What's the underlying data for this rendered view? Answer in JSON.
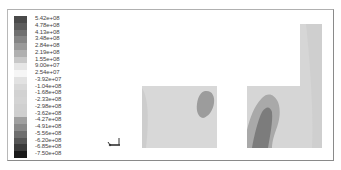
{
  "chart_data": {
    "type": "heatmap",
    "title": "",
    "xlabel": "",
    "ylabel": "",
    "legend": {
      "position": "left",
      "levels": [
        {
          "label": "5.42e+08",
          "value": 542000000,
          "color": "#4a4a4a"
        },
        {
          "label": "4.78e+08",
          "value": 478000000,
          "color": "#5c5c5c"
        },
        {
          "label": "4.13e+08",
          "value": 413000000,
          "color": "#707070"
        },
        {
          "label": "3.48e+08",
          "value": 348000000,
          "color": "#858585"
        },
        {
          "label": "2.84e+08",
          "value": 284000000,
          "color": "#9a9a9a"
        },
        {
          "label": "2.19e+08",
          "value": 219000000,
          "color": "#b0b0b0"
        },
        {
          "label": "1.55e+08",
          "value": 155000000,
          "color": "#c8c8c8"
        },
        {
          "label": "9.00e+07",
          "value": 90000000,
          "color": "#e6e6e6"
        },
        {
          "label": "2.54e+07",
          "value": 25400000,
          "color": "#f6f6f6"
        },
        {
          "label": "-3.92e+07",
          "value": -39200000,
          "color": "#e2e2e2"
        },
        {
          "label": "-1.04e+08",
          "value": -104000000,
          "color": "#d8d8d8"
        },
        {
          "label": "-1.68e+08",
          "value": -168000000,
          "color": "#d2d2d2"
        },
        {
          "label": "-2.33e+08",
          "value": -233000000,
          "color": "#d4d4d4"
        },
        {
          "label": "-2.98e+08",
          "value": -298000000,
          "color": "#d0d0d0"
        },
        {
          "label": "-3.62e+08",
          "value": -362000000,
          "color": "#cfcfcf"
        },
        {
          "label": "-4.27e+08",
          "value": -427000000,
          "color": "#a0a0a0"
        },
        {
          "label": "-4.91e+08",
          "value": -491000000,
          "color": "#8a8a8a"
        },
        {
          "label": "-5.56e+08",
          "value": -556000000,
          "color": "#6e6e6e"
        },
        {
          "label": "-6.20e+08",
          "value": -620000000,
          "color": "#555555"
        },
        {
          "label": "-6.85e+08",
          "value": -685000000,
          "color": "#3a3a3a"
        },
        {
          "label": "-7.50e+08",
          "value": -750000000,
          "color": "#1a1a1a"
        }
      ]
    },
    "regions": [
      {
        "name": "left-block",
        "fill": "#d6d6d6",
        "hotspot": {
          "fill": "#9a9a9a",
          "approx_value": "-4.27e+08"
        }
      },
      {
        "name": "right-l-shape",
        "fill": "#d4d4d4",
        "bands": [
          {
            "fill": "#a8a8a8",
            "approx_value": "-4.27e+08"
          },
          {
            "fill": "#7e7e7e",
            "approx_value": "-5.56e+08"
          }
        ]
      }
    ],
    "grid": false,
    "axis_triad": true
  },
  "legend_labels": [
    "5.42e+08",
    "4.78e+08",
    "4.13e+08",
    "3.48e+08",
    "2.84e+08",
    "2.19e+08",
    "1.55e+08",
    "9.00e+07",
    "2.54e+07",
    "-3.92e+07",
    "-1.04e+08",
    "-1.68e+08",
    "-2.33e+08",
    "-2.98e+08",
    "-3.62e+08",
    "-4.27e+08",
    "-4.91e+08",
    "-5.56e+08",
    "-6.20e+08",
    "-6.85e+08",
    "-7.50e+08"
  ]
}
